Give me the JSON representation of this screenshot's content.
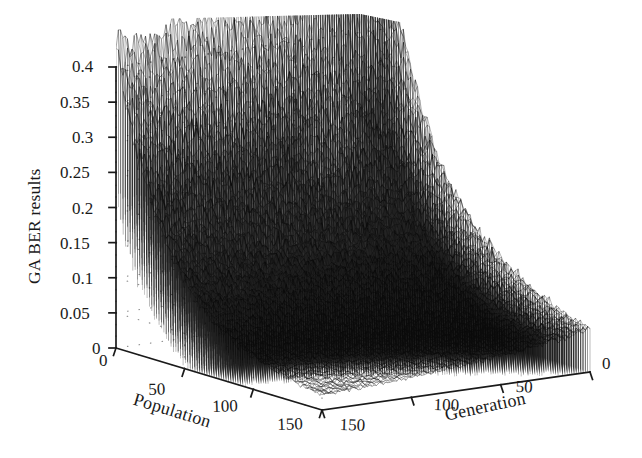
{
  "figure": {
    "type": "3d-surface-mesh",
    "background_color": "#ffffff",
    "mesh_color": "#1a1a1a",
    "grid_color": "#8c8c8c",
    "axis_color": "#1a1a1a"
  },
  "axes": {
    "z": {
      "label": "GA BER results",
      "ticks": [
        "0",
        "0.05",
        "0.1",
        "0.15",
        "0.2",
        "0.25",
        "0.3",
        "0.35",
        "0.4"
      ],
      "min": 0,
      "max": 0.4,
      "step": 0.05
    },
    "x": {
      "label": "Population",
      "ticks": [
        "0",
        "50",
        "100",
        "150"
      ],
      "min": 0,
      "max": 150,
      "step": 50
    },
    "y": {
      "label": "Generation",
      "ticks": [
        "0",
        "50",
        "100",
        "150"
      ],
      "min": 0,
      "max": 150,
      "step": 50,
      "direction": "right-to-left"
    }
  },
  "chart_data": {
    "type": "surface",
    "title": "",
    "xlabel": "Population",
    "ylabel": "Generation",
    "zlabel": "GA BER results",
    "xlim": [
      0,
      150
    ],
    "ylim": [
      0,
      150
    ],
    "zlim": [
      0,
      0.4
    ],
    "grid": true,
    "legend": "none",
    "z_ticks": [
      0,
      0.05,
      0.1,
      0.15,
      0.2,
      0.25,
      0.3,
      0.35,
      0.4
    ],
    "x_ticks": [
      0,
      50,
      100,
      150
    ],
    "y_ticks": [
      0,
      50,
      100,
      150
    ],
    "peak_value": 0.43,
    "peak_at": {
      "population": 0,
      "generation": 30
    },
    "ridge_back_left": [
      0.05,
      0.08,
      0.12,
      0.17,
      0.24,
      0.33,
      0.43
    ],
    "ridge_back_right": [
      0.43,
      0.36,
      0.31,
      0.28,
      0.26,
      0.24,
      0.23
    ],
    "front_edge": [
      0.0,
      0.005,
      0.01,
      0.01,
      0.008,
      0.006,
      0.005
    ]
  }
}
